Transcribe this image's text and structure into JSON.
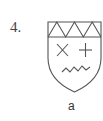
{
  "figure": {
    "number_label": "4.",
    "caption": "a",
    "elements": [
      "shield-outline",
      "zigzag-chief",
      "saltire-cross",
      "plus-cross",
      "wavy-line"
    ],
    "stroke_color": "#555555"
  }
}
